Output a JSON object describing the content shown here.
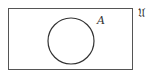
{
  "diagram": {
    "type": "venn",
    "universe": {
      "label": "𝔘",
      "rect": {
        "x": 8.5,
        "y": 8.5,
        "w": 124,
        "h": 61
      }
    },
    "sets": [
      {
        "label": "A",
        "cx": 71,
        "cy": 41,
        "r": 23
      }
    ],
    "colors": {
      "stroke": "#333333",
      "background": "#ffffff"
    }
  }
}
